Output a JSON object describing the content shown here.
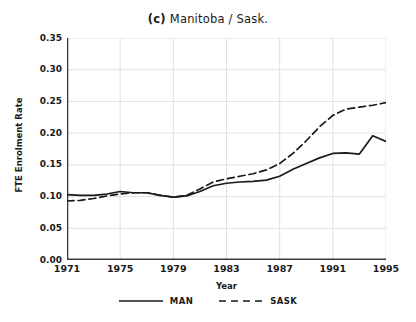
{
  "chart_data": {
    "type": "line",
    "title_index": "(c)",
    "title_text": "Manitoba / Sask.",
    "xlabel": "Year",
    "ylabel": "FTE Enrolment Rate",
    "xlim": [
      1971,
      1995
    ],
    "ylim": [
      0.0,
      0.35
    ],
    "grid": true,
    "legend_position": "bottom-center",
    "x": [
      1971,
      1972,
      1973,
      1974,
      1975,
      1976,
      1977,
      1978,
      1979,
      1980,
      1981,
      1982,
      1983,
      1984,
      1985,
      1986,
      1987,
      1988,
      1989,
      1990,
      1991,
      1992,
      1993,
      1994,
      1995
    ],
    "xticks": [
      1971,
      1975,
      1979,
      1983,
      1987,
      1991,
      1995
    ],
    "xtick_labels": [
      "1971",
      "1975",
      "1979",
      "1983",
      "1987",
      "1991",
      "1995"
    ],
    "yticks": [
      0.0,
      0.05,
      0.1,
      0.15,
      0.2,
      0.25,
      0.3,
      0.35
    ],
    "ytick_labels": [
      "0.00",
      "0.05",
      "0.10",
      "0.15",
      "0.20",
      "0.25",
      "0.30",
      "0.35"
    ],
    "series": [
      {
        "name": "MAN",
        "label": "MAN",
        "style": "solid",
        "color": "#1a1a1a",
        "values": [
          0.103,
          0.102,
          0.102,
          0.104,
          0.108,
          0.106,
          0.106,
          0.102,
          0.099,
          0.101,
          0.108,
          0.117,
          0.121,
          0.123,
          0.124,
          0.126,
          0.132,
          0.143,
          0.152,
          0.161,
          0.168,
          0.169,
          0.167,
          0.196,
          0.187
        ]
      },
      {
        "name": "SASK",
        "label": "SASK",
        "style": "dashed",
        "color": "#1a1a1a",
        "values": [
          0.093,
          0.094,
          0.097,
          0.101,
          0.104,
          0.106,
          0.106,
          0.102,
          0.099,
          0.102,
          0.112,
          0.123,
          0.128,
          0.132,
          0.136,
          0.142,
          0.152,
          0.168,
          0.188,
          0.21,
          0.228,
          0.238,
          0.241,
          0.244,
          0.248
        ]
      }
    ]
  }
}
